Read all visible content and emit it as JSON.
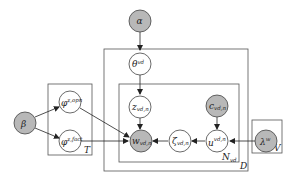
{
  "diagram": {
    "type": "plate-notation graphical model",
    "nodes": [
      {
        "id": "alpha",
        "label": "α",
        "sup": "",
        "sub": "",
        "observed": true
      },
      {
        "id": "theta",
        "label": "θ",
        "sup": "vd",
        "sub": "",
        "observed": false
      },
      {
        "id": "z",
        "label": "z",
        "sup": "",
        "sub": "vd,n",
        "observed": false
      },
      {
        "id": "c",
        "label": "c",
        "sup": "",
        "sub": "vd,n",
        "observed": true
      },
      {
        "id": "beta",
        "label": "β",
        "sup": "",
        "sub": "",
        "observed": true
      },
      {
        "id": "phi_topic",
        "label": "φ",
        "sup": "z,opn",
        "sub": "",
        "observed": false
      },
      {
        "id": "phi_fact",
        "label": "φ",
        "sup": "z,fact",
        "sub": "",
        "observed": false
      },
      {
        "id": "w",
        "label": "w",
        "sup": "",
        "sub": "vd,n",
        "observed": true
      },
      {
        "id": "zeta",
        "label": "ζ",
        "sup": "",
        "sub": "vd,n",
        "observed": false
      },
      {
        "id": "u",
        "label": "u",
        "sup": "vd,n",
        "sub": "",
        "observed": false
      },
      {
        "id": "lambda",
        "label": "λ",
        "sup": "w",
        "sub": "",
        "observed": true
      }
    ],
    "edges": [
      {
        "from": "alpha",
        "to": "theta"
      },
      {
        "from": "theta",
        "to": "z"
      },
      {
        "from": "z",
        "to": "w"
      },
      {
        "from": "beta",
        "to": "phi_topic"
      },
      {
        "from": "beta",
        "to": "phi_fact"
      },
      {
        "from": "phi_topic",
        "to": "w"
      },
      {
        "from": "phi_fact",
        "to": "w"
      },
      {
        "from": "c",
        "to": "u"
      },
      {
        "from": "u",
        "to": "zeta"
      },
      {
        "from": "zeta",
        "to": "w"
      },
      {
        "from": "lambda",
        "to": "u"
      }
    ],
    "plates": [
      {
        "id": "T",
        "label": "T"
      },
      {
        "id": "D",
        "label": "D"
      },
      {
        "id": "N",
        "label": "N",
        "sub": "vd"
      },
      {
        "id": "V",
        "label": "V"
      }
    ]
  }
}
